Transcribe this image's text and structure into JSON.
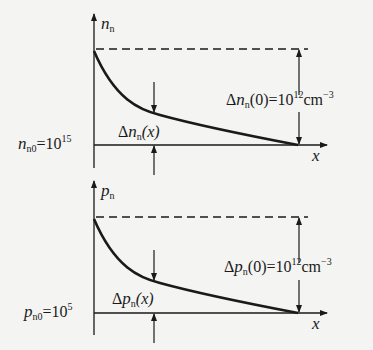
{
  "panels": [
    {
      "id": "electron",
      "y_axis_label": {
        "symbol": "n",
        "sub": "n"
      },
      "x_axis_label": "x",
      "equilibrium_label": {
        "symbol": "n",
        "sub": "n0",
        "eq": "=10",
        "exp": "15"
      },
      "excess_at_zero_label": {
        "prefix": "Δ",
        "symbol": "n",
        "sub": "n",
        "arg": "(0)=10",
        "exp": "12",
        "unit": "cm",
        "unit_exp": "−3"
      },
      "excess_x_label": {
        "prefix": "Δ",
        "symbol": "n",
        "sub": "n",
        "arg": "(x)"
      }
    },
    {
      "id": "hole",
      "y_axis_label": {
        "symbol": "p",
        "sub": "n"
      },
      "x_axis_label": "x",
      "equilibrium_label": {
        "symbol": "p",
        "sub": "n0",
        "eq": "=10",
        "exp": "5"
      },
      "excess_at_zero_label": {
        "prefix": "Δ",
        "symbol": "p",
        "sub": "n",
        "arg": "(0)=10",
        "exp": "12",
        "unit": "cm",
        "unit_exp": "−3"
      },
      "excess_x_label": {
        "prefix": "Δ",
        "symbol": "p",
        "sub": "n",
        "arg": "(x)"
      }
    }
  ]
}
